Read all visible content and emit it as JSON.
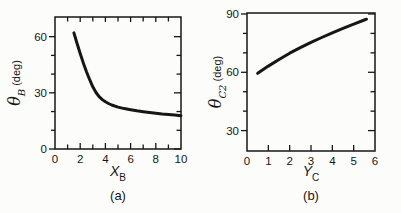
{
  "figure": {
    "background": "#fcfcfb",
    "ink": "#161616"
  },
  "panels": [
    {
      "caption": "(a)",
      "xlabel": {
        "var": "X",
        "sub": "B"
      },
      "ylabel": {
        "var": "θ",
        "sub": "B",
        "unit": "(deg)"
      }
    },
    {
      "caption": "(b)",
      "xlabel": {
        "var": "Y",
        "sub": "C"
      },
      "ylabel": {
        "var": "θ",
        "sub": "C2",
        "unit": "(deg)"
      }
    }
  ],
  "chart_data": [
    {
      "type": "line",
      "panel": "(a)",
      "title": "",
      "xlabel": "X_B",
      "ylabel": "theta_B (deg)",
      "xlim": [
        0,
        10
      ],
      "ylim": [
        0,
        70.5
      ],
      "grid": false,
      "legend": false,
      "top_ticks": true,
      "right_ticks": true,
      "xticks": {
        "major": [
          0,
          2,
          4,
          6,
          8,
          10
        ],
        "minor": [
          1,
          3,
          5,
          7,
          9
        ],
        "labels": [
          "0",
          "2",
          "4",
          "6",
          "8",
          "10"
        ]
      },
      "yticks": {
        "major": [
          0,
          30,
          60
        ],
        "minor": [
          10,
          20,
          40,
          50
        ],
        "labels": [
          "0",
          "30",
          "60"
        ]
      },
      "series": [
        {
          "name": "theta_B_curve",
          "x": [
            1.5,
            1.75,
            2,
            2.25,
            2.5,
            2.75,
            3,
            3.25,
            3.5,
            3.75,
            4,
            4.25,
            4.5,
            5,
            5.5,
            6,
            6.5,
            7,
            7.5,
            8,
            8.5,
            9,
            9.5,
            10
          ],
          "y": [
            62,
            56.5,
            51,
            46,
            41.3,
            37,
            33.2,
            30.2,
            28,
            26.4,
            25.2,
            24.3,
            23.5,
            22.4,
            21.6,
            21,
            20.4,
            19.9,
            19.5,
            19.1,
            18.7,
            18.4,
            18.1,
            17.8
          ]
        }
      ]
    },
    {
      "type": "line",
      "panel": "(b)",
      "title": "",
      "xlabel": "Y_C",
      "ylabel": "theta_C2 (deg)",
      "xlim": [
        0,
        6
      ],
      "ylim": [
        19.5,
        90.5
      ],
      "grid": false,
      "legend": false,
      "top_ticks": false,
      "right_ticks": true,
      "xticks": {
        "major": [
          0,
          1,
          2,
          3,
          4,
          5,
          6
        ],
        "minor": [],
        "labels": [
          "0",
          "1",
          "2",
          "3",
          "4",
          "5",
          "6"
        ]
      },
      "yticks": {
        "major": [
          30,
          60,
          90
        ],
        "minor": [
          40,
          50,
          70,
          80
        ],
        "labels": [
          "30",
          "60",
          "90"
        ]
      },
      "series": [
        {
          "name": "theta_C2_curve",
          "x": [
            0.5,
            1,
            1.5,
            2,
            2.5,
            3,
            3.5,
            4,
            4.5,
            5,
            5.5,
            5.6
          ],
          "y": [
            59.5,
            63.2,
            66.6,
            69.8,
            72.7,
            75.4,
            77.9,
            80.3,
            82.6,
            84.8,
            86.9,
            87.3
          ]
        }
      ]
    }
  ]
}
